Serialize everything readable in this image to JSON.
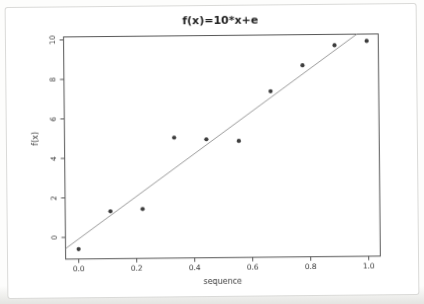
{
  "chart_data": {
    "type": "scatter",
    "title": "f(x)=10*x+e",
    "xlabel": "sequence",
    "ylabel": "f(x)",
    "x": [
      0.0,
      0.111,
      0.222,
      0.333,
      0.444,
      0.556,
      0.667,
      0.778,
      0.889,
      1.0
    ],
    "y": [
      -0.6,
      1.3,
      1.4,
      5.0,
      4.9,
      4.8,
      7.3,
      8.6,
      9.6,
      9.8
    ],
    "fit_line": {
      "kind": "least-squares-abline",
      "slope": 10.6,
      "intercept": -0.09
    },
    "x_ticks": [
      "0.0",
      "0.2",
      "0.4",
      "0.6",
      "0.8",
      "1.0"
    ],
    "y_ticks": [
      "0",
      "2",
      "4",
      "6",
      "8",
      "10"
    ],
    "xlim": [
      -0.045,
      1.04
    ],
    "ylim": [
      -1.1,
      10.15
    ],
    "grid": false,
    "legend_position": "none",
    "marker": "filled-circle",
    "colors": {
      "frame": "#565656",
      "tick_text": "#3a3a3a",
      "title_text": "#1f1f1f",
      "point": "#3d3d3d",
      "line": "#9a9a9a",
      "card_border": "#dadad8",
      "page_background": "#fdfdfc",
      "bottom_edge_shade": "#e4e4e1"
    }
  }
}
